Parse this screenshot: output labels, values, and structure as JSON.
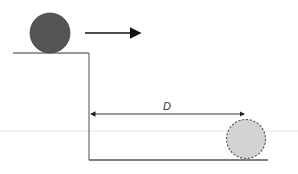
{
  "diagram": {
    "distance_label": "D",
    "colors": {
      "ball": "#555555",
      "ghost_ball": "#d3d3d3",
      "lines": "#666666",
      "arrow": "#111111"
    }
  }
}
